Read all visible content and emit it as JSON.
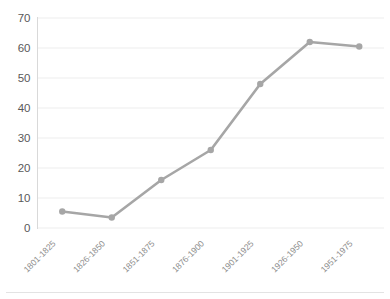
{
  "chart_data": {
    "type": "line",
    "title": "",
    "subtitle": "",
    "xlabel": "",
    "ylabel": "",
    "categories": [
      "1801-1825",
      "1826-1850",
      "1851-1875",
      "1876-1900",
      "1901-1925",
      "1926-1950",
      "1951-1975"
    ],
    "series": [
      {
        "name": "",
        "values": [
          5.5,
          3.5,
          16,
          26,
          48,
          62,
          60.5
        ],
        "color": "#a6a6a6",
        "marker": "circle",
        "marker_color": "#a6a6a6"
      }
    ],
    "ylim": [
      0,
      70
    ],
    "yticks": [
      0,
      10,
      20,
      30,
      40,
      50,
      60,
      70
    ],
    "ytick_labels": [
      "0",
      "10",
      "20",
      "30",
      "40",
      "50",
      "60",
      "70"
    ],
    "grid": {
      "horizontal": true,
      "vertical": false,
      "color": "#ededed"
    },
    "legend": {
      "visible": false,
      "position": "none",
      "entries": []
    },
    "axis": {
      "y_axis_line": true,
      "y_axis_color": "#d9d9d9",
      "x_tick_label_rotation": -45,
      "x_tick_label_color": "#8c8c8c",
      "y_tick_label_color": "#595959"
    },
    "background": "#ffffff"
  }
}
